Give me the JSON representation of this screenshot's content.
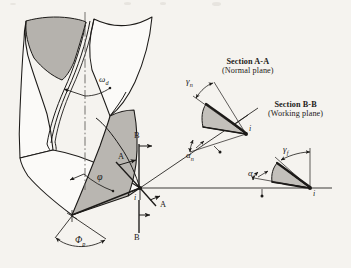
{
  "figure": {
    "background_color": "#f5f3ef",
    "line_color": "#1c1a18",
    "flute_fill": "#b5b2ad",
    "flank_fill": "#b9b6b1",
    "wedge_fill": "#c3c0bb",
    "body_fill": "#fbfaf8"
  },
  "sections": {
    "a": {
      "title": "Section A-A",
      "plane": "(Normal plane)",
      "rake_angle": "γ",
      "rake_sub": "n",
      "clearance_angle": "α",
      "clearance_sub": "n",
      "point_label": "i"
    },
    "b": {
      "title": "Section B-B",
      "plane": "(Working plane)",
      "rake_angle": "γ",
      "rake_sub": "f",
      "clearance_angle": "α",
      "clearance_sub": "f",
      "point_label": "i"
    }
  },
  "drill": {
    "helix_angle": "ω",
    "helix_angle_sub": "d",
    "point_angle": "φ",
    "point_angle_sub": "",
    "arc_angle": "Φ",
    "arc_angle_sub": "p",
    "cutting_point": "i"
  },
  "cut_markers": {
    "a_top": "A",
    "a_bottom": "A",
    "b_top": "B",
    "b_bottom": "B"
  }
}
